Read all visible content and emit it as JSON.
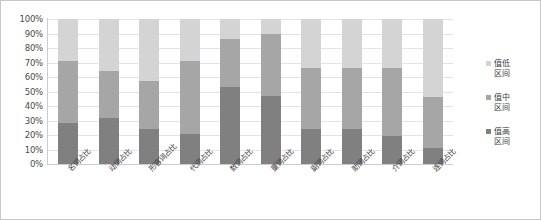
{
  "chart_data": {
    "type": "bar",
    "stacked": true,
    "normalized": true,
    "title": "",
    "xlabel": "",
    "ylabel": "",
    "ylim": [
      0,
      100
    ],
    "ytick_labels": [
      "100%",
      "90%",
      "80%",
      "70%",
      "60%",
      "50%",
      "40%",
      "30%",
      "20%",
      "10%",
      "0%"
    ],
    "ytick_values": [
      100,
      90,
      80,
      70,
      60,
      50,
      40,
      30,
      20,
      10,
      0
    ],
    "grid": true,
    "legend_position": "right",
    "categories": [
      "名词占比",
      "动词占比",
      "形容词占比",
      "代词占比",
      "数词占比",
      "量词占比",
      "副词占比",
      "助词占比",
      "介词占比",
      "连词占比"
    ],
    "series": [
      {
        "name": "值高区间",
        "color": "#808080",
        "values": [
          28,
          32,
          24,
          21,
          53,
          47,
          24,
          24,
          19,
          11
        ]
      },
      {
        "name": "值中区间",
        "color": "#a6a6a6",
        "values": [
          43,
          32,
          33,
          50,
          33,
          43,
          42,
          42,
          47,
          35
        ]
      },
      {
        "name": "值低区间",
        "color": "#d4d4d4",
        "values": [
          29,
          36,
          43,
          29,
          14,
          10,
          34,
          34,
          34,
          54
        ]
      }
    ],
    "legend_entries": [
      {
        "label": "值低区间",
        "color": "#d4d4d4"
      },
      {
        "label": "值中区间",
        "color": "#a6a6a6"
      },
      {
        "label": "值高区间",
        "color": "#808080"
      }
    ]
  },
  "colors": {
    "low": "#d4d4d4",
    "mid": "#a6a6a6",
    "high": "#808080",
    "grid": "#dfe3ea",
    "axis": "#c9ced6",
    "text": "#3d3d3d",
    "border": "#c8c8c8",
    "background": "#ffffff"
  }
}
